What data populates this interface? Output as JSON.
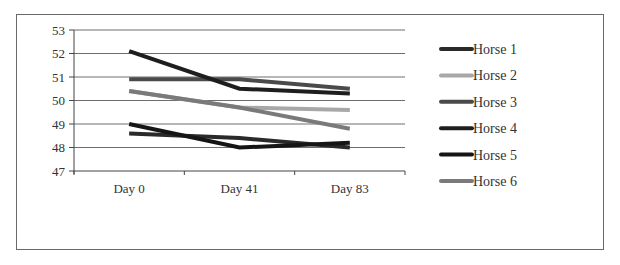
{
  "chart_data": {
    "type": "line",
    "title": "",
    "xlabel": "",
    "ylabel": "",
    "categories": [
      "Day 0",
      "Day 41",
      "Day 83"
    ],
    "ylim": [
      47,
      53
    ],
    "yticks": [
      47,
      48,
      49,
      50,
      51,
      52,
      53
    ],
    "grid": true,
    "legend_position": "right",
    "series": [
      {
        "name": "Horse 1",
        "color": "#2a2a2a",
        "values": [
          48.6,
          48.4,
          48.0
        ]
      },
      {
        "name": "Horse 2",
        "color": "#a8a8a8",
        "values": [
          50.4,
          49.7,
          49.6
        ]
      },
      {
        "name": "Horse 3",
        "color": "#4a4a4a",
        "values": [
          50.9,
          50.9,
          50.5
        ]
      },
      {
        "name": "Horse 4",
        "color": "#1e1e1e",
        "values": [
          52.1,
          50.5,
          50.3
        ]
      },
      {
        "name": "Horse 5",
        "color": "#151515",
        "values": [
          49.0,
          48.0,
          48.2
        ]
      },
      {
        "name": "Horse 6",
        "color": "#7a7a7a",
        "values": [
          50.4,
          49.7,
          48.8
        ]
      }
    ]
  }
}
